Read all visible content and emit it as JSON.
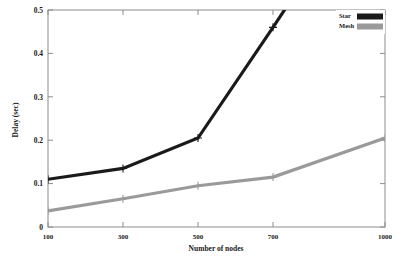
{
  "chart_data": {
    "type": "line",
    "title": "",
    "xlabel": "Number of nodes",
    "ylabel": "Delay (sec)",
    "categories": [
      "100",
      "300",
      "500",
      "700",
      "1000"
    ],
    "x": [
      100,
      300,
      500,
      700,
      1000
    ],
    "xlim": [
      100,
      1000
    ],
    "ylim": [
      0,
      0.5
    ],
    "grid": false,
    "legend_position": "top-right",
    "xticks": [
      "100",
      "300",
      "500",
      "700",
      "1000"
    ],
    "yticks": [
      "0",
      "0.1",
      "0.2",
      "0.3",
      "0.4",
      "0.5"
    ],
    "ytick_values": [
      0,
      0.1,
      0.2,
      0.3,
      0.4,
      0.5
    ],
    "series": [
      {
        "name": "Star",
        "color": "#1a1a1a",
        "values": [
          0.11,
          0.135,
          0.205,
          0.46,
          0.85
        ],
        "clipped_above_ylim": true
      },
      {
        "name": "Mesh",
        "color": "#9a9a9a",
        "values": [
          0.037,
          0.065,
          0.095,
          0.115,
          0.205
        ],
        "clipped_above_ylim": false
      }
    ]
  },
  "legend": {
    "entries": [
      {
        "label": "Star",
        "color": "#1a1a1a"
      },
      {
        "label": "Mesh",
        "color": "#9a9a9a"
      }
    ]
  },
  "axes": {
    "y_title": "Delay (sec)",
    "x_title": "Number of nodes",
    "y_labels": [
      "0.5",
      "0.4",
      "0.3",
      "0.2",
      "0.1",
      "0"
    ],
    "x_labels": [
      "100",
      "300",
      "500",
      "700",
      "1000"
    ]
  }
}
